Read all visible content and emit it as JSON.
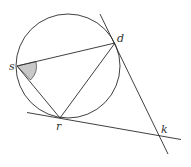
{
  "diagram": {
    "type": "circle-geometry",
    "stroke_color": "#2a2a2a",
    "shade_color": "#c8c8c8",
    "circle": {
      "cx": 68,
      "cy": 66,
      "r": 52
    },
    "points": {
      "s": {
        "label": "s",
        "x": 17,
        "y": 66
      },
      "d": {
        "label": "d",
        "x": 115,
        "y": 43
      },
      "r": {
        "label": "r",
        "x": 60,
        "y": 118
      },
      "k": {
        "label": "k",
        "x": 159,
        "y": 135
      }
    },
    "shaded_angle": "s"
  }
}
